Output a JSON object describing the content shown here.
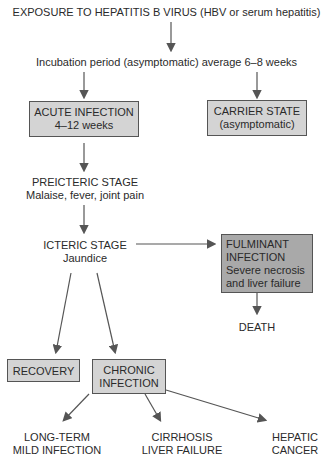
{
  "diagram": {
    "exposure": "EXPOSURE TO HEPATITIS B VIRUS (HBV or serum hepatitis)",
    "incubation": "Incubation period (asymptomatic) average 6–8 weeks",
    "acute": {
      "title": "ACUTE INFECTION",
      "detail": "4–12 weeks"
    },
    "carrier": {
      "title": "CARRIER STATE",
      "detail": "(asymptomatic)"
    },
    "preicteric": {
      "title": "PREICTERIC STAGE",
      "detail": "Malaise, fever, joint pain"
    },
    "icteric": {
      "title": "ICTERIC STAGE",
      "detail": "Jaundice"
    },
    "fulminant": {
      "title1": "FULMINANT",
      "title2": "INFECTION",
      "detail1": "Severe necrosis",
      "detail2": "and liver failure"
    },
    "death": "DEATH",
    "recovery": "RECOVERY",
    "chronic": {
      "line1": "CHRONIC",
      "line2": "INFECTION"
    },
    "outcomes": [
      {
        "line1": "LONG-TERM",
        "line2": "MILD INFECTION"
      },
      {
        "line1": "CIRRHOSIS",
        "line2": "LIVER FAILURE"
      },
      {
        "line1": "HEPATIC",
        "line2": "CANCER"
      }
    ],
    "colors": {
      "light_box": "#d4d4d4",
      "dark_box": "#a9a9a9",
      "arrow": "#555555"
    }
  }
}
